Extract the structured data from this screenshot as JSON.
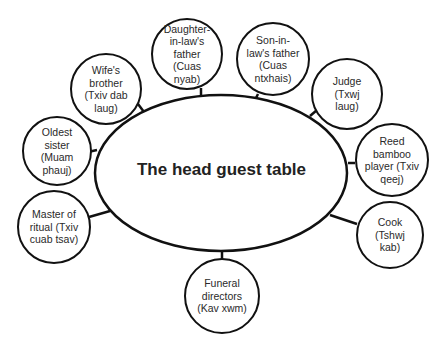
{
  "diagram": {
    "center": {
      "label": "The head guest table"
    },
    "nodes": [
      {
        "id": "oldest-sister",
        "label": "Oldest\nsister\n(Muam\nphauj)"
      },
      {
        "id": "wifes-brother",
        "label": "Wife's\nbrother\n(Txiv dab\nlaug)"
      },
      {
        "id": "daughter-in-laws-father",
        "label": "Daughter-\nin-law's\nfather\n(Cuas nyab)"
      },
      {
        "id": "son-in-laws-father",
        "label": "Son-in-\nlaw's father\n(Cuas\nntxhais)"
      },
      {
        "id": "judge",
        "label": "Judge (Txwj\nlaug)"
      },
      {
        "id": "reed-bamboo-player",
        "label": "Reed\nbamboo\nplayer (Txiv\nqeej)"
      },
      {
        "id": "cook",
        "label": "Cook\n(Tshwj kab)"
      },
      {
        "id": "funeral-directors",
        "label": "Funeral\ndirectors\n(Kav xwm)"
      },
      {
        "id": "master-of-ritual",
        "label": "Master of\nritual (Txiv\ncuab tsav)"
      }
    ],
    "colors": {
      "stroke": "#111111",
      "fill": "#ffffff",
      "text": "#222222"
    }
  }
}
